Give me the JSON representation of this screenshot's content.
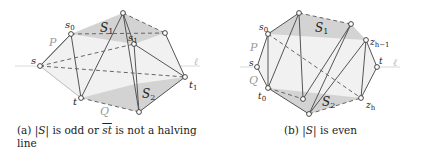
{
  "panel_a": {
    "caption_prefix": "(a) |",
    "caption_S": "S",
    "caption_mid": "| is odd or ",
    "caption_st": "st",
    "caption_rest": " is not a halving",
    "caption_line2": "line",
    "labels": {
      "s": "s",
      "s0": "s",
      "s0_sub": "0",
      "s1": "s",
      "s1_sub": "1",
      "t": "t",
      "t1": "t",
      "t1_sub": "1",
      "S1": "S",
      "S1_sub": "1",
      "S2": "S",
      "S2_sub": "2",
      "P": "P",
      "Q": "Q",
      "ell": "ℓ"
    }
  },
  "panel_b": {
    "caption_prefix": "(b) |",
    "caption_S": "S",
    "caption_rest": "| is even",
    "labels": {
      "s": "s",
      "s0": "s",
      "s0_sub": "0",
      "t0": "t",
      "t0_sub": "0",
      "t": "t",
      "zh1": "z",
      "zh1_sub": "h−1",
      "zh": "z",
      "zh_sub": "h",
      "S1": "S",
      "S1_sub": "1",
      "S2": "S",
      "S2_sub": "2",
      "P": "P",
      "Q": "Q",
      "ell": "ℓ"
    }
  },
  "colors": {
    "edge": "#555555",
    "dashed": "#666666",
    "region_fill": "#d6d6d6",
    "light_region": "#ececec",
    "halving_line": "#cfcfcf",
    "label_gray": "#9a9a9a"
  }
}
